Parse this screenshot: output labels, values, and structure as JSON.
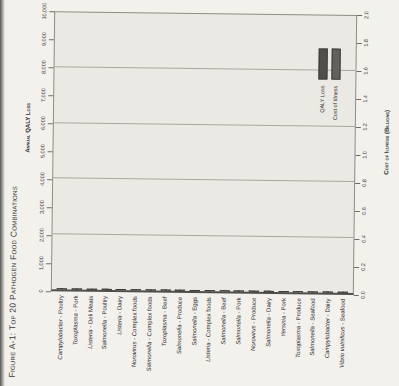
{
  "figure": {
    "title": "Figure A-1: Top 20 Pathogen Food Combinations"
  },
  "chart_data": {
    "type": "bar",
    "title": "Figure A-1: Top 20 Pathogen Food Combinations",
    "orientation": "figure printed rotated 90 degrees; bars vertical, all text reads bottom-to-top",
    "grid": "horizontal gridlines every 2,000 QALY (0.4 billion $)",
    "separator": " - ",
    "categories": [
      {
        "pathogen": "Campylobacter",
        "food": "Poultry"
      },
      {
        "pathogen": "Toxoplasma",
        "food": "Pork"
      },
      {
        "pathogen": "Listeria",
        "food": "Deli Meats"
      },
      {
        "pathogen": "Salmonella",
        "food": "Poultry"
      },
      {
        "pathogen": "Listeria",
        "food": "Dairy"
      },
      {
        "pathogen": "Norovirus",
        "food": "Complex foods"
      },
      {
        "pathogen": "Salmonella",
        "food": "Complex foods"
      },
      {
        "pathogen": "Toxoplasma",
        "food": "Beef"
      },
      {
        "pathogen": "Salmonella",
        "food": "Produce"
      },
      {
        "pathogen": "Salmonella",
        "food": "Eggs"
      },
      {
        "pathogen": "Listeria",
        "food": "Complex foods"
      },
      {
        "pathogen": "Salmonella",
        "food": "Beef"
      },
      {
        "pathogen": "Salmonella",
        "food": "Pork"
      },
      {
        "pathogen": "Norovirus",
        "food": "Produce"
      },
      {
        "pathogen": "Salmonella",
        "food": "Dairy"
      },
      {
        "pathogen": "Yersinia",
        "food": "Pork"
      },
      {
        "pathogen": "Toxoplasma",
        "food": "Produce"
      },
      {
        "pathogen": "Salmonella",
        "food": "Seafood"
      },
      {
        "pathogen": "Campylobacter",
        "food": "Dairy"
      },
      {
        "pathogen": "Vibrio vulnificus",
        "food": "Seafood"
      }
    ],
    "series": [
      {
        "name": "QALY Loss",
        "axis": "left",
        "color": "#504f4c",
        "values": [
          9500,
          4500,
          3950,
          3600,
          2600,
          2250,
          3200,
          2500,
          2700,
          1850,
          1200,
          950,
          950,
          650,
          850,
          850,
          650,
          700,
          850,
          380
        ]
      },
      {
        "name": "Cost of Illness",
        "axis": "right",
        "color": "#62615d",
        "values": [
          1.26,
          1.19,
          1.05,
          0.71,
          0.72,
          0.9,
          0.63,
          0.69,
          0.53,
          0.37,
          0.35,
          0.19,
          0.19,
          0.29,
          0.17,
          0.15,
          0.18,
          0.14,
          0.11,
          0.25
        ]
      }
    ],
    "left_axis": {
      "label": "Annual QALY Loss",
      "min": 0,
      "max": 10000,
      "tick_step": 1000,
      "ticks": [
        "0",
        "1,000",
        "2,000",
        "3,000",
        "4,000",
        "5,000",
        "6,000",
        "7,000",
        "8,000",
        "9,000",
        "10,000"
      ]
    },
    "right_axis": {
      "label": "Cost of Illness (Billions)",
      "min": 0,
      "max": 2.0,
      "tick_step": 0.2,
      "ticks": [
        "0.0",
        "0.2",
        "0.4",
        "0.6",
        "0.8",
        "1.0",
        "1.2",
        "1.4",
        "1.6",
        "1.8",
        "2.0"
      ]
    },
    "legend": {
      "position": "inside top-right",
      "items": [
        "QALY Loss",
        "Cost of Illness"
      ]
    }
  }
}
